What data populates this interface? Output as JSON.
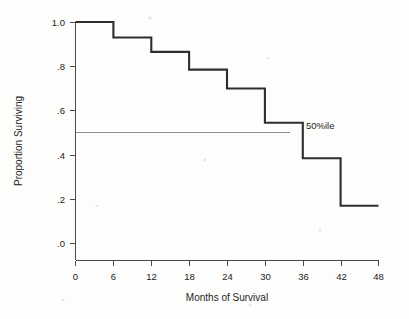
{
  "chart_data": {
    "type": "line",
    "subtype": "step",
    "title": "",
    "xlabel": "Months of Survival",
    "ylabel": "Proportion Surviving",
    "xlim": [
      0,
      48
    ],
    "ylim": [
      0.0,
      1.0
    ],
    "xticks": [
      0,
      6,
      12,
      18,
      24,
      30,
      36,
      42,
      48
    ],
    "xtick_labels": [
      "0",
      "6",
      "12",
      "18",
      "24",
      "30",
      "36",
      "42",
      "48"
    ],
    "yticks": [
      0.0,
      0.2,
      0.4,
      0.6,
      0.8,
      1.0
    ],
    "ytick_labels": [
      ".0",
      ".2",
      ".4",
      ".6",
      ".8",
      "1.0"
    ],
    "grid": false,
    "legend": false,
    "x": [
      0,
      6,
      12,
      18,
      24,
      30,
      36,
      42,
      48
    ],
    "values": [
      1.0,
      0.93,
      0.865,
      0.785,
      0.7,
      0.545,
      0.385,
      0.17,
      0.17
    ],
    "series": [
      {
        "name": "Survival",
        "step_segments": [
          {
            "x_start": 0,
            "x_end": 6,
            "y": 1.0
          },
          {
            "x_start": 6,
            "x_end": 12,
            "y": 0.93
          },
          {
            "x_start": 12,
            "x_end": 18,
            "y": 0.865
          },
          {
            "x_start": 18,
            "x_end": 24,
            "y": 0.785
          },
          {
            "x_start": 24,
            "x_end": 30,
            "y": 0.7
          },
          {
            "x_start": 30,
            "x_end": 36,
            "y": 0.545
          },
          {
            "x_start": 36,
            "x_end": 42,
            "y": 0.385
          },
          {
            "x_start": 42,
            "x_end": 48,
            "y": 0.17
          }
        ],
        "color": "#2e2e2e"
      }
    ],
    "annotations": [
      {
        "name": "median-reference",
        "label": "50%ile",
        "y": 0.5,
        "x_start": 0,
        "x_end": 34,
        "label_x": 36.5,
        "color": "#8d8d8d"
      }
    ]
  },
  "axes": {
    "x_title": "Months of Survival",
    "y_title": "Proportion Surviving"
  }
}
